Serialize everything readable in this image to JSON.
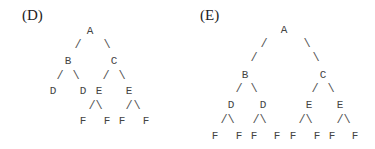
{
  "panels": [
    {
      "label": "(D)",
      "label_pos": [
        22,
        8
      ],
      "nodes": [
        {
          "text": "A",
          "x": 90,
          "y": 31
        },
        {
          "text": "B",
          "x": 68,
          "y": 61
        },
        {
          "text": "C",
          "x": 114,
          "y": 61
        },
        {
          "text": "D",
          "x": 53,
          "y": 91
        },
        {
          "text": "D",
          "x": 83,
          "y": 91
        },
        {
          "text": "E",
          "x": 99,
          "y": 91
        },
        {
          "text": "E",
          "x": 129,
          "y": 91
        },
        {
          "text": "F",
          "x": 83,
          "y": 121
        },
        {
          "text": "F",
          "x": 107,
          "y": 121
        },
        {
          "text": "F",
          "x": 122,
          "y": 121
        },
        {
          "text": "F",
          "x": 146,
          "y": 121
        }
      ],
      "edges": [
        {
          "text": "/",
          "x": 78,
          "y": 45
        },
        {
          "text": "\\",
          "x": 107,
          "y": 45
        },
        {
          "text": "/",
          "x": 60,
          "y": 76
        },
        {
          "text": "\\",
          "x": 76,
          "y": 76
        },
        {
          "text": "/",
          "x": 106,
          "y": 76
        },
        {
          "text": "\\",
          "x": 122,
          "y": 76
        },
        {
          "text": "/",
          "x": 92,
          "y": 106
        },
        {
          "text": "\\",
          "x": 99,
          "y": 106
        },
        {
          "text": "/",
          "x": 129,
          "y": 106
        },
        {
          "text": "\\",
          "x": 137,
          "y": 106
        }
      ]
    },
    {
      "label": "(E)",
      "label_pos": [
        200,
        8
      ],
      "nodes": [
        {
          "text": "A",
          "x": 284,
          "y": 30
        },
        {
          "text": "B",
          "x": 245,
          "y": 75
        },
        {
          "text": "C",
          "x": 323,
          "y": 75
        },
        {
          "text": "D",
          "x": 231,
          "y": 105
        },
        {
          "text": "D",
          "x": 263,
          "y": 105
        },
        {
          "text": "E",
          "x": 309,
          "y": 105
        },
        {
          "text": "E",
          "x": 340,
          "y": 105
        },
        {
          "text": "F",
          "x": 215,
          "y": 136
        },
        {
          "text": "F",
          "x": 239,
          "y": 136
        },
        {
          "text": "F",
          "x": 254,
          "y": 136
        },
        {
          "text": "F",
          "x": 277,
          "y": 136
        },
        {
          "text": "F",
          "x": 293,
          "y": 136
        },
        {
          "text": "F",
          "x": 317,
          "y": 136
        },
        {
          "text": "F",
          "x": 332,
          "y": 136
        },
        {
          "text": "F",
          "x": 355,
          "y": 136
        }
      ],
      "edges": [
        {
          "text": "/",
          "x": 264,
          "y": 44
        },
        {
          "text": "/",
          "x": 254,
          "y": 58
        },
        {
          "text": "\\",
          "x": 307,
          "y": 44
        },
        {
          "text": "\\",
          "x": 316,
          "y": 58
        },
        {
          "text": "/",
          "x": 239,
          "y": 89
        },
        {
          "text": "\\",
          "x": 254,
          "y": 89
        },
        {
          "text": "/",
          "x": 315,
          "y": 89
        },
        {
          "text": "\\",
          "x": 331,
          "y": 89
        },
        {
          "text": "/",
          "x": 224,
          "y": 120
        },
        {
          "text": "\\",
          "x": 231,
          "y": 120
        },
        {
          "text": "/",
          "x": 256,
          "y": 120
        },
        {
          "text": "\\",
          "x": 263,
          "y": 120
        },
        {
          "text": "/",
          "x": 302,
          "y": 120
        },
        {
          "text": "\\",
          "x": 309,
          "y": 120
        },
        {
          "text": "/",
          "x": 340,
          "y": 120
        },
        {
          "text": "\\",
          "x": 347,
          "y": 120
        }
      ]
    }
  ]
}
